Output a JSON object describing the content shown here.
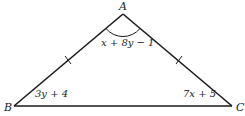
{
  "figure": {
    "type": "isosceles-triangle",
    "stroke_color": "#1a1a1a",
    "background": "#ffffff",
    "vertices": [
      {
        "name": "A",
        "x": 123,
        "y": 14
      },
      {
        "name": "B",
        "x": 14,
        "y": 106
      },
      {
        "name": "C",
        "x": 232,
        "y": 106
      }
    ],
    "congruent_sides": [
      "AB",
      "AC"
    ],
    "labels": {
      "vertex_a": "A",
      "vertex_b": "B",
      "vertex_c": "C",
      "angle_a": "x + 8y − 1",
      "angle_b": "3y + 4",
      "angle_c": "7x + 5"
    }
  }
}
